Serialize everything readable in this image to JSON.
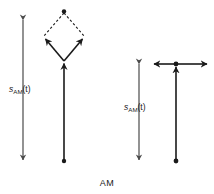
{
  "figure": {
    "caption": "AM",
    "modulation": "AM",
    "panels": [
      {
        "id": "left",
        "axis_label_main": "s",
        "axis_label_sub": "AM",
        "axis_label_arg": "(t)",
        "axis_label_full": "s_AM(t)",
        "axis_arrow_top": "arrow-up",
        "axis_arrow_bottom": "arrow-down",
        "phasor_shape": "rhombus",
        "dashed_edges": 2,
        "solid_arrows": 2,
        "carrier_arrow": "arrow-up",
        "origin_marker": "dot",
        "apex_marker": "dot"
      },
      {
        "id": "right",
        "axis_label_main": "s",
        "axis_label_sub": "AM",
        "axis_label_arg": "(t)",
        "axis_label_full": "s_AM(t)",
        "axis_arrow_top": "arrow-up",
        "axis_arrow_bottom": "arrow-down",
        "phasor_shape": "collinear-pair",
        "dashed_edges": 0,
        "solid_arrows": 2,
        "carrier_arrow": "arrow-up",
        "origin_marker": "dot",
        "apex_marker": "dot"
      }
    ]
  },
  "colors": {
    "ink": "#1a1a1a",
    "axis": "#4a4a4a",
    "background": "#ffffff"
  }
}
